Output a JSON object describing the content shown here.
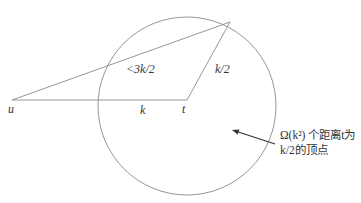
{
  "diagram": {
    "colors": {
      "stroke": "#8a8a8a",
      "text": "#333333",
      "arrow": "#333333"
    },
    "circle": {
      "cx": 187,
      "cy": 106,
      "r": 89
    },
    "points": {
      "u": {
        "x": 12,
        "y": 100,
        "label": "u"
      },
      "t": {
        "x": 187,
        "y": 100,
        "label": "t"
      },
      "p": {
        "x": 230,
        "y": 22
      }
    },
    "edges": {
      "ut": {
        "label": "k"
      },
      "tp": {
        "label": "k/2"
      },
      "up": {
        "label": "<3k/2"
      }
    },
    "annotation": {
      "line1": "Ω(k²) 个距离t为",
      "line2": "k/2的顶点",
      "arrow": {
        "from_x": 275,
        "from_y": 144,
        "to_x": 232,
        "to_y": 130
      }
    }
  }
}
